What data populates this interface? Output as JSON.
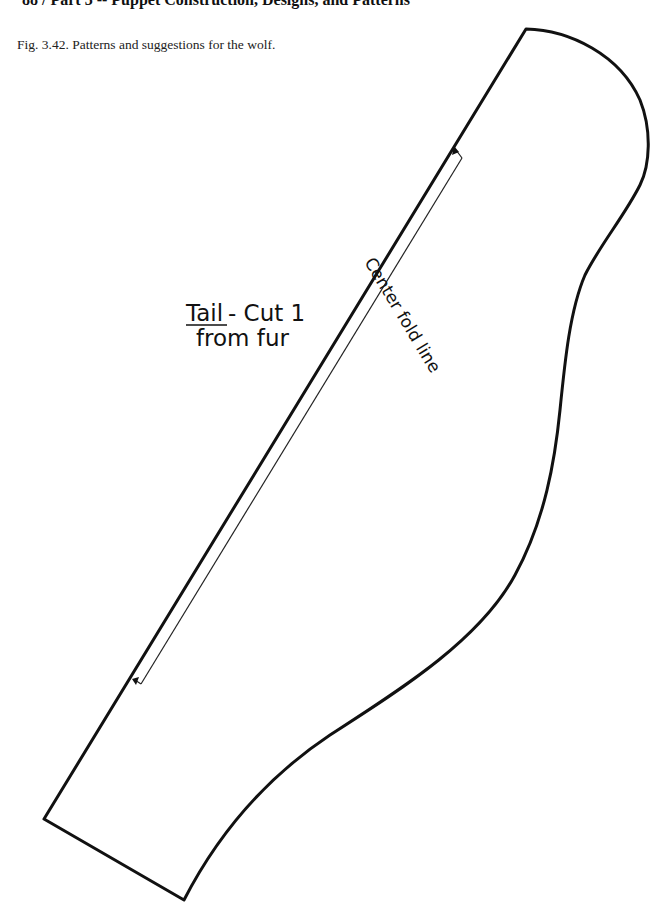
{
  "header": {
    "running_head": "88 / Part 3 -- Puppet Construction, Designs, and Patterns"
  },
  "figure": {
    "caption": "Fig. 3.42. Patterns and suggestions for the wolf."
  },
  "pattern": {
    "piece_name": "Tail",
    "label_line1_suffix": "- Cut 1",
    "label_line2": "from fur",
    "fold_label": "Center fold line",
    "stroke_color": "#111111"
  }
}
